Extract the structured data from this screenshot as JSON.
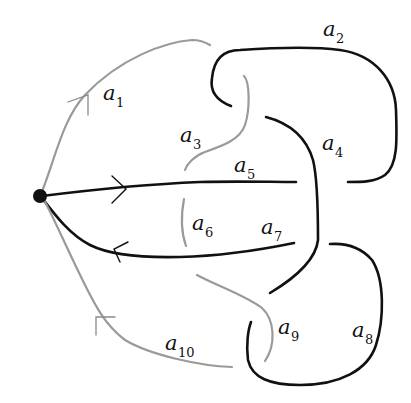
{
  "diagram": {
    "type": "knot-diagram-with-basepoint",
    "colors": {
      "black_arcs": "#111111",
      "gray_arcs": "#9a9a9a",
      "background": "#ffffff"
    },
    "basepoint": {
      "x": 40,
      "y": 196
    },
    "labels": [
      {
        "id": "a1",
        "base": "a",
        "sub": "1",
        "x": 103,
        "y": 100
      },
      {
        "id": "a2",
        "base": "a",
        "sub": "2",
        "x": 323,
        "y": 36
      },
      {
        "id": "a3",
        "base": "a",
        "sub": "3",
        "x": 180,
        "y": 142
      },
      {
        "id": "a4",
        "base": "a",
        "sub": "4",
        "x": 322,
        "y": 150
      },
      {
        "id": "a5",
        "base": "a",
        "sub": "5",
        "x": 234,
        "y": 172
      },
      {
        "id": "a6",
        "base": "a",
        "sub": "6",
        "x": 192,
        "y": 230
      },
      {
        "id": "a7",
        "base": "a",
        "sub": "7",
        "x": 261,
        "y": 234
      },
      {
        "id": "a8",
        "base": "a",
        "sub": "8",
        "x": 352,
        "y": 337
      },
      {
        "id": "a9",
        "base": "a",
        "sub": "9",
        "x": 278,
        "y": 334
      },
      {
        "id": "a10",
        "base": "a",
        "sub": "10",
        "x": 165,
        "y": 350
      }
    ]
  }
}
